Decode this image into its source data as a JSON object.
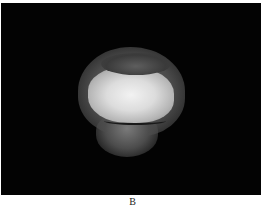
{
  "figure": {
    "panel_label": "B",
    "background_color": "#030303"
  }
}
